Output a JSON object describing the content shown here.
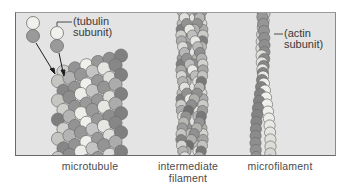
{
  "figure": {
    "background": "#e4e4e4",
    "colors": {
      "light_subunit": "#f0f0ec",
      "dark_subunit": "#9a9a9a",
      "mid_subunit": "#c4c4c4",
      "outline": "#6e6e6e"
    },
    "structures": [
      {
        "id": "microtubule",
        "caption_lines": [
          "microtubule"
        ],
        "annotation_lines": [
          "(tubulin",
          "subunit)"
        ]
      },
      {
        "id": "intermediate-filament",
        "caption_lines": [
          "intermediate",
          "filament"
        ]
      },
      {
        "id": "microfilament",
        "caption_lines": [
          "microfilament"
        ],
        "annotation_lines": [
          "(actin",
          "subunit)"
        ]
      }
    ]
  }
}
